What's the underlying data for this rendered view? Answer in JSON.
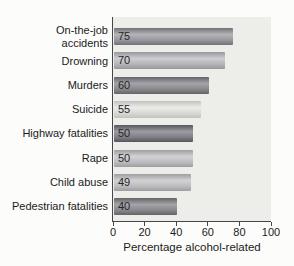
{
  "page": {
    "background": "#fcfcfa",
    "panel_bg": "#ededea",
    "axis_color": "#47474b",
    "text_color": "#1b1b1b"
  },
  "chart_data": {
    "type": "bar",
    "orientation": "horizontal",
    "title": "",
    "xlabel": "Percentage alcohol-related",
    "ylabel": "",
    "xlim": [
      0,
      100
    ],
    "xticks": [
      0,
      20,
      40,
      60,
      80,
      100
    ],
    "grid": false,
    "legend": null,
    "categories": [
      "On-the-job\naccidents",
      "Drowning",
      "Murders",
      "Suicide",
      "Highway fatalities",
      "Rape",
      "Child abuse",
      "Pedestrian fatalities"
    ],
    "values": [
      75,
      70,
      60,
      55,
      50,
      50,
      49,
      40
    ],
    "value_labels": [
      "75",
      "70",
      "60",
      "55",
      "50",
      "50",
      "49",
      "40"
    ],
    "bar_shades": [
      "medium",
      "light",
      "dark",
      "lightest",
      "darkest",
      "lighter",
      "lighter",
      "dark"
    ],
    "palette": {
      "medium": {
        "edge": "#717177",
        "band": "#b4b4b8",
        "mid": "#96969c"
      },
      "light": {
        "edge": "#98989c",
        "band": "#cdcdd1",
        "mid": "#b5b5b9"
      },
      "dark": {
        "edge": "#646468",
        "band": "#a4a4a8",
        "mid": "#88888c"
      },
      "lightest": {
        "edge": "#c2c2c0",
        "band": "#ebebe8",
        "mid": "#d8d8d5"
      },
      "darkest": {
        "edge": "#56565c",
        "band": "#9b9ba1",
        "mid": "#7e7e84"
      },
      "lighter": {
        "edge": "#9e9ea0",
        "band": "#d2d2d4",
        "mid": "#bcbcbe"
      }
    }
  }
}
